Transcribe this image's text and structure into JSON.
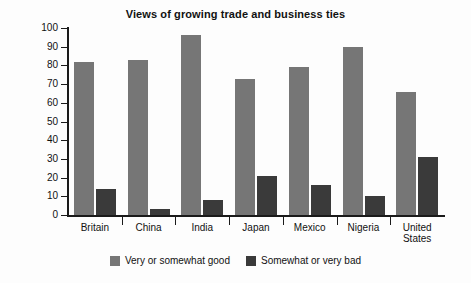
{
  "chart_data": {
    "type": "bar",
    "title": "Views of growing trade and business ties",
    "xlabel": "",
    "ylabel": "Percentage",
    "ylim": [
      0,
      100
    ],
    "ytick_step": 10,
    "yticks": [
      100,
      90,
      80,
      70,
      60,
      50,
      40,
      30,
      20,
      10,
      0
    ],
    "grid": false,
    "legend_position": "bottom",
    "categories": [
      "Britain",
      "China",
      "India",
      "Japan",
      "Mexico",
      "Nigeria",
      "United States"
    ],
    "series": [
      {
        "name": "Very or somewhat good",
        "color": "#767676",
        "values": [
          82,
          83,
          96,
          73,
          79,
          90,
          66
        ]
      },
      {
        "name": "Somewhat or very bad",
        "color": "#3a3a3a",
        "values": [
          14,
          3,
          8,
          21,
          16,
          10,
          31
        ]
      }
    ]
  },
  "axis": {
    "y_title": "Percentage"
  },
  "legend": {
    "items": [
      {
        "label": "Very or somewhat good",
        "color": "#767676"
      },
      {
        "label": "Somewhat or very bad",
        "color": "#3a3a3a"
      }
    ]
  }
}
